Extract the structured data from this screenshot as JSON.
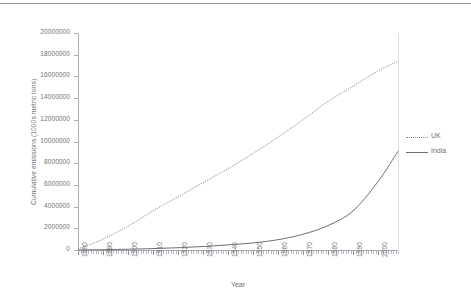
{
  "chart_data": {
    "type": "line",
    "title": "",
    "xlabel": "Year",
    "ylabel": "Cumulative emissions (1000s metric tons)",
    "xlim": [
      1880,
      2008
    ],
    "ylim": [
      0,
      20000000
    ],
    "grid": false,
    "legend_position": "right",
    "x_tick_labels": [
      "1880",
      "1890",
      "1900",
      "1910",
      "1920",
      "1930",
      "1940",
      "1950",
      "1960",
      "1970",
      "1980",
      "1990",
      "2000"
    ],
    "y_tick_labels": [
      "20000000",
      "18000000",
      "16000000",
      "14000000",
      "12000000",
      "10000000",
      "8000000",
      "6000000",
      "4000000",
      "2000000",
      "0"
    ],
    "y_tick_values": [
      20000000,
      18000000,
      16000000,
      14000000,
      12000000,
      10000000,
      8000000,
      6000000,
      4000000,
      2000000,
      0
    ],
    "x": [
      1880,
      1890,
      1900,
      1910,
      1920,
      1930,
      1940,
      1950,
      1960,
      1970,
      1980,
      1990,
      2000,
      2008
    ],
    "series": [
      {
        "name": "UK",
        "style": "dotted",
        "color": "#8a8a92",
        "values": [
          100000,
          1000000,
          2200000,
          3600000,
          4900000,
          6200000,
          7500000,
          8900000,
          10400000,
          12000000,
          13700000,
          15100000,
          16500000,
          17400000
        ]
      },
      {
        "name": "India",
        "style": "solid",
        "color": "#6f6f77",
        "values": [
          10000,
          30000,
          70000,
          130000,
          210000,
          320000,
          470000,
          650000,
          950000,
          1450000,
          2250000,
          3600000,
          6300000,
          9100000
        ]
      }
    ]
  },
  "legend": {
    "entries": [
      {
        "label": "UK"
      },
      {
        "label": "India"
      }
    ]
  },
  "axes": {
    "x_title": "Year",
    "y_title": "Cumulative emissions (1000s metric tons)"
  },
  "colors": {
    "uk_line": "#8a8a92",
    "india_line": "#6f6f77",
    "axis": "#b0b0b6",
    "text": "#6f6f75",
    "rule": "#9a9aa2"
  }
}
